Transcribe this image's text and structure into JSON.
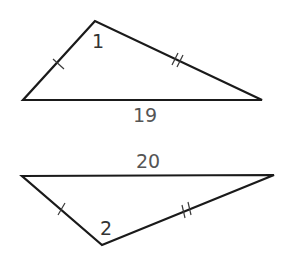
{
  "diagram": {
    "type": "two-triangles-comparison",
    "triangle_top": {
      "angle_label": "1",
      "base_label": "19",
      "vertices": {
        "apex": [
          95,
          21
        ],
        "left": [
          23,
          100
        ],
        "right": [
          262,
          100
        ]
      },
      "congruence_marks": {
        "left_side": "single tick",
        "right_side": "double tick"
      }
    },
    "triangle_bottom": {
      "angle_label": "2",
      "base_label": "20",
      "vertices": {
        "left": [
          22,
          176
        ],
        "right": [
          274,
          175
        ],
        "apex": [
          102,
          245
        ]
      },
      "congruence_marks": {
        "left_side": "single tick",
        "right_side": "double tick"
      }
    },
    "colors": {
      "stroke": "#1a1a1a",
      "label": "#555555",
      "background": "#ffffff"
    }
  }
}
